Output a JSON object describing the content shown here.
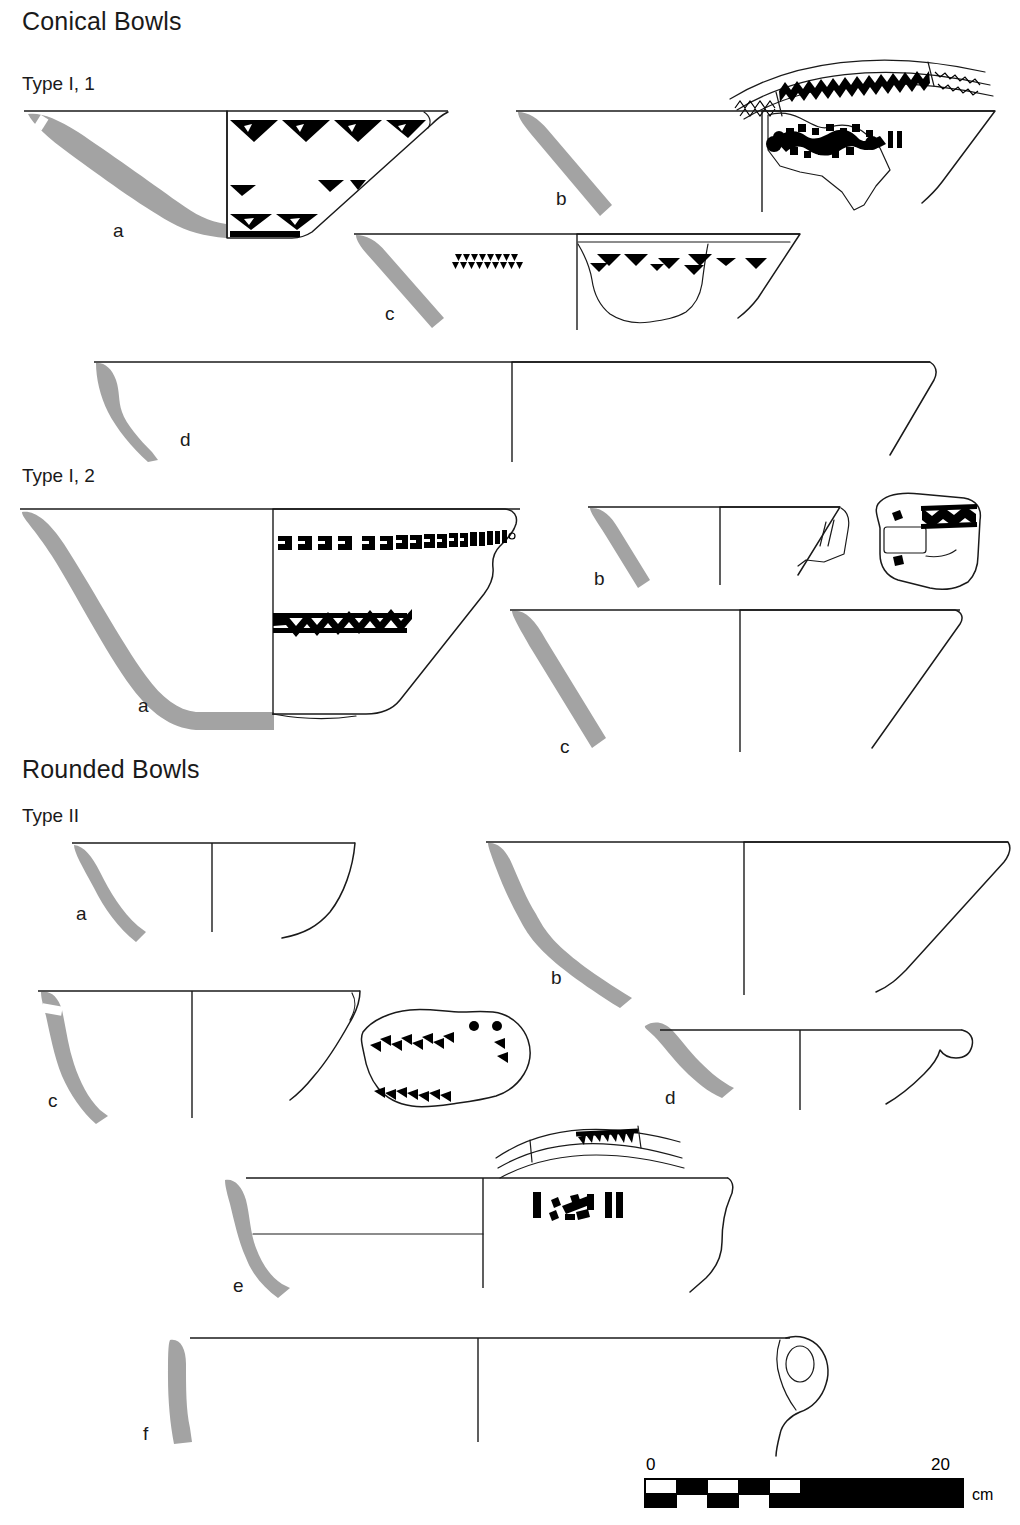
{
  "figure": {
    "sections": [
      {
        "id": "conical-bowls",
        "heading": "Conical Bowls",
        "types": [
          {
            "id": "type-i-1",
            "label": "Type I, 1",
            "items": [
              "a",
              "b",
              "c",
              "d"
            ]
          },
          {
            "id": "type-i-2",
            "label": "Type I, 2",
            "items": [
              "a",
              "b",
              "c"
            ]
          }
        ]
      },
      {
        "id": "rounded-bowls",
        "heading": "Rounded Bowls",
        "types": [
          {
            "id": "type-ii",
            "label": "Type II",
            "items": [
              "a",
              "b",
              "c",
              "d",
              "e",
              "f"
            ]
          }
        ]
      }
    ],
    "labels": {
      "conical_heading": "Conical Bowls",
      "rounded_heading": "Rounded Bowls",
      "type_i_1": "Type I, 1",
      "type_i_2": "Type I, 2",
      "type_ii": "Type II",
      "i1_a": "a",
      "i1_b": "b",
      "i1_c": "c",
      "i1_d": "d",
      "i2_a": "a",
      "i2_b": "b",
      "i2_c": "c",
      "ii_a": "a",
      "ii_b": "b",
      "ii_c": "c",
      "ii_d": "d",
      "ii_e": "e",
      "ii_f": "f"
    },
    "scale_bar": {
      "start_label": "0",
      "end_label": "20",
      "unit": "cm",
      "segments": 10,
      "total_cm": 20
    },
    "colors": {
      "profile_fill": "#a3a3a3",
      "ink": "#1a1a1a",
      "decoration": "#000000",
      "background": "#ffffff"
    }
  }
}
